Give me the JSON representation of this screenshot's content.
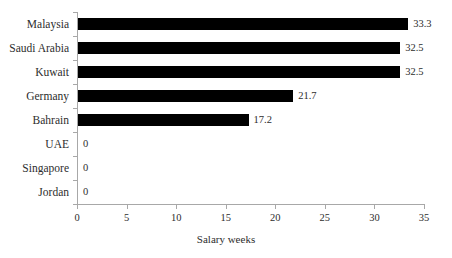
{
  "chart_data": {
    "type": "bar",
    "orientation": "horizontal",
    "title": "",
    "xlabel": "Salary weeks",
    "ylabel": "",
    "categories": [
      "Malaysia",
      "Saudi Arabia",
      "Kuwait",
      "Germany",
      "Bahrain",
      "UAE",
      "Singapore",
      "Jordan"
    ],
    "values": [
      33.3,
      32.5,
      32.5,
      21.7,
      17.2,
      0,
      0,
      0
    ],
    "value_labels": [
      "33.3",
      "32.5",
      "32.5",
      "21.7",
      "17.2",
      "0",
      "0",
      "0"
    ],
    "xlim": [
      0,
      35
    ],
    "xticks": [
      0,
      5,
      10,
      15,
      20,
      25,
      30,
      35
    ],
    "xtick_labels": [
      "0",
      "5",
      "10",
      "15",
      "20",
      "25",
      "30",
      "35"
    ],
    "grid": false,
    "legend": false,
    "bar_color": "#000000",
    "axis_color": "#a8a8a8",
    "text_color": "#2d2d2d",
    "background": "#ffffff"
  }
}
